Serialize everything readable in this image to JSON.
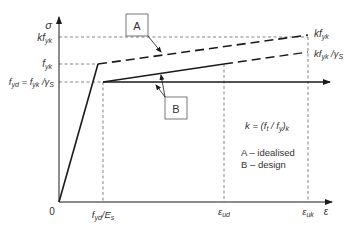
{
  "diagram": {
    "axes": {
      "y_label": "σ",
      "x_label": "ε",
      "origin_label": "0"
    },
    "y_ticks": {
      "kfyk": {
        "k": "kf",
        "sub": "yk"
      },
      "fyk": {
        "main": "f",
        "sub": "yk"
      },
      "fyd": {
        "main": "f",
        "sub1": "yd",
        "eq": " = f",
        "sub2": "yk",
        "tail": " /γ",
        "sub3": "S"
      }
    },
    "x_ticks": {
      "fyd_Es": {
        "main": "f",
        "sub1": "yd",
        "mid": "/E",
        "sub2": "s"
      },
      "eps_ud": {
        "main": "ε",
        "sub": "ud"
      },
      "eps_uk": {
        "main": "ε",
        "sub": "uk"
      }
    },
    "right_labels": {
      "kfyk": {
        "main": "kf",
        "sub": "yk"
      },
      "kfyk_gs": {
        "main": "kf",
        "sub1": "yk",
        "tail": " /γ",
        "sub2": "S"
      }
    },
    "callouts": {
      "A": "A",
      "B": "B"
    },
    "formula": {
      "pre": "k = (f",
      "sub1": "t",
      "mid": " / f",
      "sub2": "y",
      "post": ")",
      "sub3": "k"
    },
    "legend": [
      {
        "key": "A",
        "text": "A – idealised"
      },
      {
        "key": "B",
        "text": "B – design"
      }
    ],
    "colors": {
      "line": "#1a1a1a",
      "dash": "#555555",
      "text": "#333333"
    }
  }
}
